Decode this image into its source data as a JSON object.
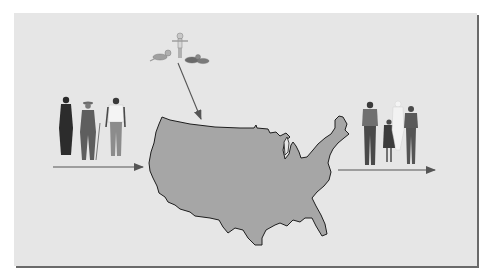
{
  "diagram": {
    "type": "population-flow",
    "colors": {
      "panel_background": "#e6e6e6",
      "panel_shadow": "#6a6a6a",
      "map_fill": "#a6a6a6",
      "map_outline": "#1e1e1e",
      "arrow": "#555555"
    },
    "nodes": [
      {
        "id": "immigrants",
        "depiction": "three adults (woman in dark robe, older man with cane and hat, man in white shirt)",
        "position": "left"
      },
      {
        "id": "births",
        "depiction": "infants and toddler",
        "position": "top"
      },
      {
        "id": "usa",
        "depiction": "map of contiguous United States",
        "position": "center"
      },
      {
        "id": "emigrants",
        "depiction": "family: man, child, faded figure, woman",
        "position": "right"
      }
    ],
    "edges": [
      {
        "from": "immigrants",
        "to": "usa",
        "direction": "right"
      },
      {
        "from": "births",
        "to": "usa",
        "direction": "down"
      },
      {
        "from": "usa",
        "to": "emigrants",
        "direction": "right"
      }
    ]
  }
}
